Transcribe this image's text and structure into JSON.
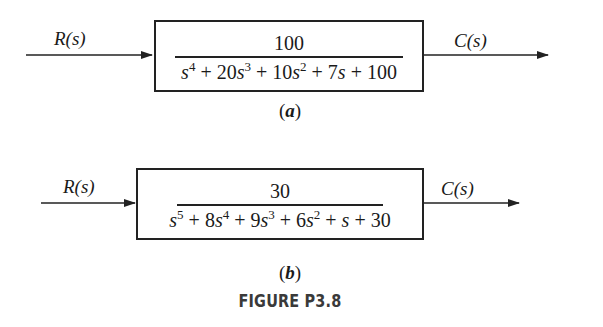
{
  "figure": {
    "title": "FIGURE P3.8",
    "colors": {
      "line": "#222222",
      "text": "#1a1a1a",
      "title": "#3a3a3a",
      "background": "#ffffff"
    }
  },
  "diagram_a": {
    "caption_letter": "a",
    "input_label": "R(s)",
    "output_label": "C(s)",
    "transfer_function": {
      "numerator": "100",
      "denominator_terms": [
        {
          "coef": "",
          "var": "s",
          "exp": "4",
          "op": ""
        },
        {
          "coef": "20",
          "var": "s",
          "exp": "3",
          "op": "+"
        },
        {
          "coef": "10",
          "var": "s",
          "exp": "2",
          "op": "+"
        },
        {
          "coef": "7",
          "var": "s",
          "exp": "",
          "op": "+"
        },
        {
          "coef": "100",
          "var": "",
          "exp": "",
          "op": "+"
        }
      ],
      "denominator_text": "s^4 + 20s^3 + 10s^2 + 7s + 100"
    }
  },
  "diagram_b": {
    "caption_letter": "b",
    "input_label": "R(s)",
    "output_label": "C(s)",
    "transfer_function": {
      "numerator": "30",
      "denominator_terms": [
        {
          "coef": "",
          "var": "s",
          "exp": "5",
          "op": ""
        },
        {
          "coef": "8",
          "var": "s",
          "exp": "4",
          "op": "+"
        },
        {
          "coef": "9",
          "var": "s",
          "exp": "3",
          "op": "+"
        },
        {
          "coef": "6",
          "var": "s",
          "exp": "2",
          "op": "+"
        },
        {
          "coef": "",
          "var": "s",
          "exp": "",
          "op": "+"
        },
        {
          "coef": "30",
          "var": "",
          "exp": "",
          "op": "+"
        }
      ],
      "denominator_text": "s^5 + 8s^4 + 9s^3 + 6s^2 + s + 30"
    }
  }
}
